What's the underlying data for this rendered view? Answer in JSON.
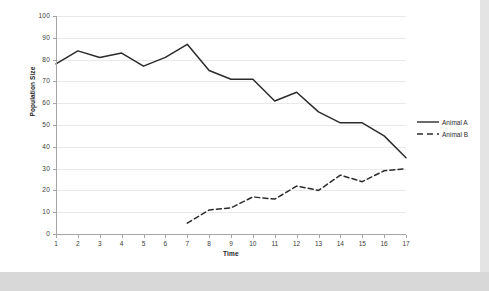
{
  "chart_data": {
    "type": "line",
    "title": "",
    "xlabel": "Time",
    "ylabel": "Population Size",
    "xlim": [
      1,
      17
    ],
    "ylim": [
      0,
      100
    ],
    "ytick_step": 10,
    "grid": true,
    "legend_position": "right",
    "x": [
      1,
      2,
      3,
      4,
      5,
      6,
      7,
      8,
      9,
      10,
      11,
      12,
      13,
      14,
      15,
      16,
      17
    ],
    "xtick_labels": [
      "1",
      "2",
      "3",
      "4",
      "5",
      "6",
      "7",
      "8",
      "9",
      "10",
      "11",
      "12",
      "13",
      "14",
      "15",
      "16",
      "17"
    ],
    "ytick_labels": [
      "0",
      "10",
      "20",
      "30",
      "40",
      "50",
      "60",
      "70",
      "80",
      "90",
      "100"
    ],
    "series": [
      {
        "name": "Animal A",
        "style": "solid",
        "color": "#2b2b2b",
        "x": [
          1,
          2,
          3,
          4,
          5,
          6,
          7,
          8,
          9,
          10,
          11,
          12,
          13,
          14,
          15,
          16,
          17
        ],
        "values": [
          78,
          84,
          81,
          83,
          77,
          81,
          87,
          75,
          71,
          71,
          61,
          65,
          56,
          51,
          51,
          45,
          35
        ]
      },
      {
        "name": "Animal B",
        "style": "dashed",
        "color": "#2b2b2b",
        "x": [
          7,
          8,
          9,
          10,
          11,
          12,
          13,
          14,
          15,
          16,
          17
        ],
        "values": [
          5,
          11,
          12,
          17,
          16,
          22,
          20,
          27,
          24,
          29,
          30
        ]
      }
    ]
  },
  "legend": {
    "entries": [
      {
        "label": "Animal A"
      },
      {
        "label": "Animal B"
      }
    ]
  }
}
